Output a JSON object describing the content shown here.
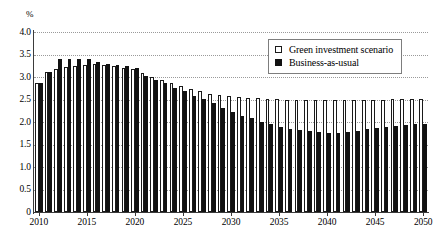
{
  "chart_data": {
    "type": "bar",
    "title": "",
    "subtitle": "",
    "xlabel": "",
    "ylabel": "%",
    "unit_label": "%",
    "ylim": [
      0,
      4.0
    ],
    "y_ticks": [
      "0",
      "0.5",
      "1.0",
      "1.5",
      "2.0",
      "2.5",
      "3.0",
      "3.5",
      "4.0"
    ],
    "y_tick_values": [
      0,
      0.5,
      1.0,
      1.5,
      2.0,
      2.5,
      3.0,
      3.5,
      4.0
    ],
    "grid": true,
    "grid_style": "dotted-horizontal",
    "legend_position": "top-right",
    "x_tick_labels": [
      "2010",
      "2015",
      "2020",
      "2025",
      "2030",
      "2035",
      "2040",
      "2045",
      "2050"
    ],
    "x_tick_values": [
      2010,
      2015,
      2020,
      2025,
      2030,
      2035,
      2040,
      2045,
      2050
    ],
    "categories": [
      "2010",
      "2011",
      "2012",
      "2013",
      "2014",
      "2015",
      "2016",
      "2017",
      "2018",
      "2019",
      "2020",
      "2021",
      "2022",
      "2023",
      "2024",
      "2025",
      "2026",
      "2027",
      "2028",
      "2029",
      "2030",
      "2031",
      "2032",
      "2033",
      "2034",
      "2035",
      "2036",
      "2037",
      "2038",
      "2039",
      "2040",
      "2041",
      "2042",
      "2043",
      "2044",
      "2045",
      "2046",
      "2047",
      "2048",
      "2049",
      "2050"
    ],
    "series": [
      {
        "name": "Green investment scenario",
        "color": "#ffffff",
        "edge_color": "#1a1a1a",
        "values": [
          2.87,
          3.12,
          3.18,
          3.22,
          3.25,
          3.27,
          3.28,
          3.27,
          3.25,
          3.21,
          3.18,
          3.08,
          3.0,
          2.93,
          2.87,
          2.8,
          2.73,
          2.68,
          2.63,
          2.6,
          2.57,
          2.55,
          2.54,
          2.53,
          2.52,
          2.51,
          2.5,
          2.5,
          2.49,
          2.49,
          2.49,
          2.49,
          2.49,
          2.5,
          2.5,
          2.5,
          2.5,
          2.51,
          2.51,
          2.51,
          2.52
        ]
      },
      {
        "name": "Business-as-usual",
        "color": "#111111",
        "edge_color": "#111111",
        "values": [
          2.87,
          3.12,
          3.4,
          3.4,
          3.4,
          3.4,
          3.33,
          3.28,
          3.27,
          3.25,
          3.2,
          3.02,
          2.94,
          2.86,
          2.76,
          2.68,
          2.57,
          2.51,
          2.42,
          2.32,
          2.22,
          2.14,
          2.08,
          2.01,
          1.96,
          1.9,
          1.85,
          1.82,
          1.79,
          1.77,
          1.75,
          1.76,
          1.78,
          1.8,
          1.84,
          1.87,
          1.9,
          1.92,
          1.94,
          1.95,
          1.95
        ]
      }
    ]
  },
  "legend": {
    "items": [
      {
        "label": "Green investment scenario",
        "marker": "hollow-square"
      },
      {
        "label": "Business-as-usual",
        "marker": "filled-square"
      }
    ]
  }
}
